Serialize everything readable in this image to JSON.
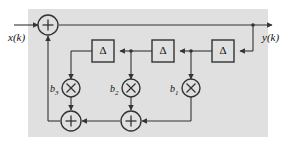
{
  "figure": {
    "type": "block-diagram",
    "background_color": "#e0e0e0",
    "line_color": "#333333"
  },
  "signals": {
    "input_label": "x(k)",
    "output_label": "y(k)"
  },
  "delays": [
    {
      "id": "delay-1",
      "symbol": "Δ"
    },
    {
      "id": "delay-2",
      "symbol": "Δ"
    },
    {
      "id": "delay-3",
      "symbol": "Δ"
    }
  ],
  "multipliers": [
    {
      "id": "mult-b3",
      "coefficient": "b",
      "subscript": "3",
      "symbol": "×"
    },
    {
      "id": "mult-b2",
      "coefficient": "b",
      "subscript": "2",
      "symbol": "×"
    },
    {
      "id": "mult-b1",
      "coefficient": "b",
      "subscript": "1",
      "symbol": "×"
    }
  ],
  "adders": [
    {
      "id": "adder-top",
      "symbol": "+"
    },
    {
      "id": "adder-bottom-left",
      "symbol": "+"
    },
    {
      "id": "adder-bottom-right",
      "symbol": "+"
    }
  ]
}
